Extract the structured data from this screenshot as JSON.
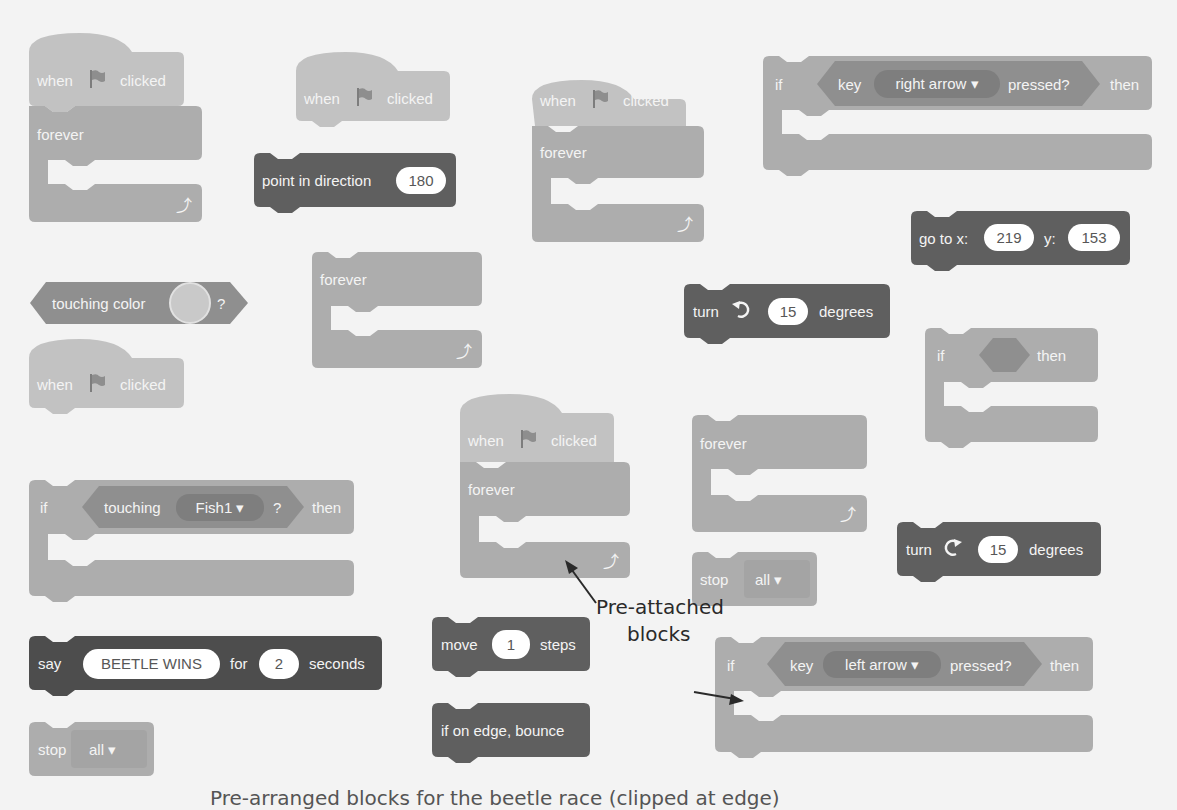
{
  "colors": {
    "event": "#c2c2c2",
    "control": "#adadad",
    "motion_dark": "#5f5f5f",
    "sensing": "#8f8f8f",
    "looks_dark": "#4d4d4d",
    "background": "#f3f3f3",
    "annotation": "#2a2a2a"
  },
  "blocks": {
    "hat1": {
      "when": "when",
      "clicked": "clicked",
      "icon": "green-flag-icon"
    },
    "forever1": {
      "label": "forever",
      "icon": "loop-arrow-icon"
    },
    "hat2": {
      "when": "when",
      "clicked": "clicked"
    },
    "point_direction": {
      "label": "point in direction",
      "value": "180"
    },
    "forever2": {
      "label": "forever"
    },
    "touching_color": {
      "label": "touching color",
      "q": "?"
    },
    "hat3": {
      "when": "when",
      "clicked": "clicked"
    },
    "if_touching": {
      "if": "if",
      "touching": "touching",
      "target": "Fish1",
      "q": "?",
      "then": "then"
    },
    "say": {
      "say": "say",
      "message": "BEETLE WINS",
      "for": "for",
      "secs": "2",
      "seconds": "seconds"
    },
    "stop1": {
      "stop": "stop",
      "option": "all"
    },
    "hat4": {
      "when": "when",
      "clicked": "clicked"
    },
    "forever3": {
      "label": "forever"
    },
    "hat5": {
      "when": "when",
      "clicked": "clicked"
    },
    "forever4": {
      "label": "forever"
    },
    "move": {
      "move": "move",
      "value": "1",
      "steps": "steps"
    },
    "bounce": {
      "label": "if on edge, bounce"
    },
    "if_right": {
      "if": "if",
      "key": "key",
      "option": "right arrow",
      "pressed": "pressed?",
      "then": "then"
    },
    "goto": {
      "label": "go to x:",
      "x": "219",
      "y_label": "y:",
      "y": "153"
    },
    "turn_left": {
      "turn": "turn",
      "value": "15",
      "degrees": "degrees"
    },
    "if_empty": {
      "if": "if",
      "then": "then"
    },
    "forever5": {
      "label": "forever"
    },
    "stop2": {
      "stop": "stop",
      "option": "all"
    },
    "turn_right": {
      "turn": "turn",
      "value": "15",
      "degrees": "degrees"
    },
    "if_left": {
      "if": "if",
      "key": "key",
      "option": "left arrow",
      "pressed": "pressed?",
      "then": "then"
    }
  },
  "annotation": {
    "line1": "Pre-attached",
    "line2": "blocks"
  },
  "dropdown_caret": "▾",
  "loop_arrow": "⤴",
  "caption_clipped": "Pre-arranged blocks for the beetle race (clipped at edge)"
}
